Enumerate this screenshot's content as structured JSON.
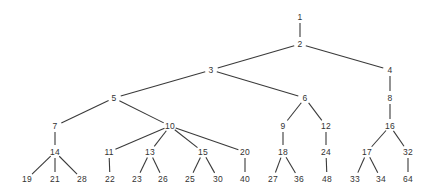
{
  "figure": {
    "kind": "tree-diagram",
    "width": 436,
    "height": 196,
    "background_color": "#ffffff",
    "edge_color": "#3a3a3a",
    "edge_width": 1.1,
    "label_color": "#333333",
    "label_font_size": 8.5
  },
  "chart_data": {
    "type": "diagram",
    "title": "",
    "nodes": [
      {
        "id": "n1",
        "label": "1",
        "x": 300,
        "y": 17,
        "depth": 0
      },
      {
        "id": "n2",
        "label": "2",
        "x": 300,
        "y": 44,
        "depth": 1
      },
      {
        "id": "n3",
        "label": "3",
        "x": 211,
        "y": 70,
        "depth": 2
      },
      {
        "id": "n4",
        "label": "4",
        "x": 390,
        "y": 70,
        "depth": 2
      },
      {
        "id": "n5",
        "label": "5",
        "x": 114,
        "y": 98,
        "depth": 3
      },
      {
        "id": "n6",
        "label": "6",
        "x": 305,
        "y": 98,
        "depth": 3
      },
      {
        "id": "n8",
        "label": "8",
        "x": 390,
        "y": 98,
        "depth": 3
      },
      {
        "id": "n7",
        "label": "7",
        "x": 55,
        "y": 126,
        "depth": 4
      },
      {
        "id": "n10",
        "label": "10",
        "x": 170,
        "y": 126,
        "depth": 4
      },
      {
        "id": "n9",
        "label": "9",
        "x": 283,
        "y": 126,
        "depth": 4
      },
      {
        "id": "n12",
        "label": "12",
        "x": 326,
        "y": 126,
        "depth": 4
      },
      {
        "id": "n16",
        "label": "16",
        "x": 390,
        "y": 126,
        "depth": 4
      },
      {
        "id": "n14",
        "label": "14",
        "x": 55,
        "y": 152,
        "depth": 5
      },
      {
        "id": "n11",
        "label": "11",
        "x": 109,
        "y": 152,
        "depth": 5
      },
      {
        "id": "n13",
        "label": "13",
        "x": 150,
        "y": 152,
        "depth": 5
      },
      {
        "id": "n15",
        "label": "15",
        "x": 203,
        "y": 152,
        "depth": 5
      },
      {
        "id": "n20",
        "label": "20",
        "x": 245,
        "y": 152,
        "depth": 5
      },
      {
        "id": "n18",
        "label": "18",
        "x": 283,
        "y": 152,
        "depth": 5
      },
      {
        "id": "n24",
        "label": "24",
        "x": 326,
        "y": 152,
        "depth": 5
      },
      {
        "id": "n17",
        "label": "17",
        "x": 367,
        "y": 152,
        "depth": 5
      },
      {
        "id": "n32",
        "label": "32",
        "x": 408,
        "y": 152,
        "depth": 5
      },
      {
        "id": "n19",
        "label": "19",
        "x": 27,
        "y": 179,
        "depth": 6
      },
      {
        "id": "n21",
        "label": "21",
        "x": 55,
        "y": 179,
        "depth": 6
      },
      {
        "id": "n28",
        "label": "28",
        "x": 82,
        "y": 179,
        "depth": 6
      },
      {
        "id": "n22",
        "label": "22",
        "x": 110,
        "y": 179,
        "depth": 6
      },
      {
        "id": "n23",
        "label": "23",
        "x": 137,
        "y": 179,
        "depth": 6
      },
      {
        "id": "n26",
        "label": "26",
        "x": 163,
        "y": 179,
        "depth": 6
      },
      {
        "id": "n25",
        "label": "25",
        "x": 190,
        "y": 179,
        "depth": 6
      },
      {
        "id": "n30",
        "label": "30",
        "x": 218,
        "y": 179,
        "depth": 6
      },
      {
        "id": "n40",
        "label": "40",
        "x": 245,
        "y": 179,
        "depth": 6
      },
      {
        "id": "n27",
        "label": "27",
        "x": 273,
        "y": 179,
        "depth": 6
      },
      {
        "id": "n36",
        "label": "36",
        "x": 299,
        "y": 179,
        "depth": 6
      },
      {
        "id": "n48",
        "label": "48",
        "x": 327,
        "y": 179,
        "depth": 6
      },
      {
        "id": "n33",
        "label": "33",
        "x": 355,
        "y": 179,
        "depth": 6
      },
      {
        "id": "n34",
        "label": "34",
        "x": 381,
        "y": 179,
        "depth": 6
      },
      {
        "id": "n64",
        "label": "64",
        "x": 408,
        "y": 179,
        "depth": 6
      }
    ],
    "edges": [
      {
        "from": "n1",
        "to": "n2"
      },
      {
        "from": "n2",
        "to": "n3"
      },
      {
        "from": "n2",
        "to": "n4"
      },
      {
        "from": "n3",
        "to": "n5"
      },
      {
        "from": "n3",
        "to": "n6"
      },
      {
        "from": "n4",
        "to": "n8"
      },
      {
        "from": "n5",
        "to": "n7"
      },
      {
        "from": "n5",
        "to": "n10"
      },
      {
        "from": "n6",
        "to": "n9"
      },
      {
        "from": "n6",
        "to": "n12"
      },
      {
        "from": "n8",
        "to": "n16"
      },
      {
        "from": "n7",
        "to": "n14"
      },
      {
        "from": "n10",
        "to": "n11"
      },
      {
        "from": "n10",
        "to": "n13"
      },
      {
        "from": "n10",
        "to": "n15"
      },
      {
        "from": "n10",
        "to": "n20"
      },
      {
        "from": "n9",
        "to": "n18"
      },
      {
        "from": "n12",
        "to": "n24"
      },
      {
        "from": "n16",
        "to": "n17"
      },
      {
        "from": "n16",
        "to": "n32"
      },
      {
        "from": "n14",
        "to": "n19"
      },
      {
        "from": "n14",
        "to": "n21"
      },
      {
        "from": "n14",
        "to": "n28"
      },
      {
        "from": "n11",
        "to": "n22"
      },
      {
        "from": "n13",
        "to": "n23"
      },
      {
        "from": "n13",
        "to": "n26"
      },
      {
        "from": "n15",
        "to": "n25"
      },
      {
        "from": "n15",
        "to": "n30"
      },
      {
        "from": "n20",
        "to": "n40"
      },
      {
        "from": "n18",
        "to": "n27"
      },
      {
        "from": "n18",
        "to": "n36"
      },
      {
        "from": "n24",
        "to": "n48"
      },
      {
        "from": "n17",
        "to": "n33"
      },
      {
        "from": "n17",
        "to": "n34"
      },
      {
        "from": "n32",
        "to": "n64"
      }
    ]
  }
}
